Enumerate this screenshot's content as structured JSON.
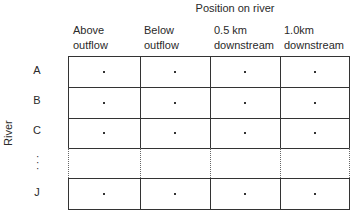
{
  "title": "Position on river",
  "row_axis_label": "River",
  "columns": [
    {
      "line1": "Above",
      "line2": "outflow"
    },
    {
      "line1": "Below",
      "line2": "outflow"
    },
    {
      "line1": "0.5 km",
      "line2": "downstream"
    },
    {
      "line1": "1.0km",
      "line2": "downstream"
    }
  ],
  "rows": [
    {
      "label": "A",
      "cells": [
        ".",
        ".",
        ".",
        "."
      ]
    },
    {
      "label": "B",
      "cells": [
        ".",
        ".",
        ".",
        "."
      ]
    },
    {
      "label": "C",
      "cells": [
        ".",
        ".",
        ".",
        "."
      ]
    },
    {
      "label": "⋮",
      "cells": [
        "",
        "",
        "",
        ""
      ],
      "ellipsis": true
    },
    {
      "label": "J",
      "cells": [
        ".",
        ".",
        ".",
        "."
      ]
    }
  ]
}
